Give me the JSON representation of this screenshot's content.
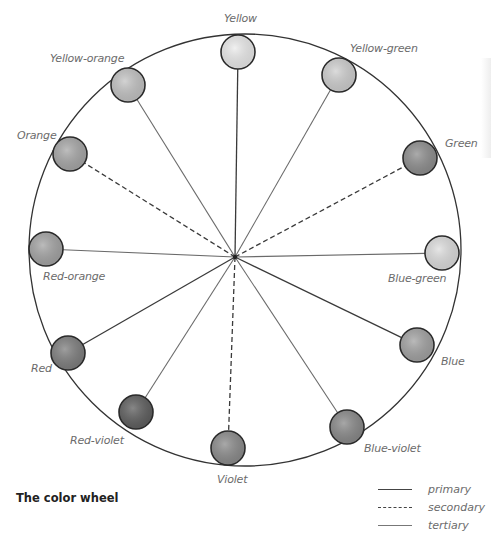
{
  "diagram": {
    "title": "The color wheel",
    "outer_circle": {
      "cx": 245,
      "cy": 250,
      "r": 216,
      "stroke": "#333333"
    },
    "hub": {
      "x": 235,
      "y": 257
    },
    "swatch_radius": 17,
    "swatches": [
      {
        "name": "Yellow",
        "type": "primary",
        "cx": 238,
        "cy": 52,
        "fill": "#ececec",
        "label_x": 224,
        "label_y": 12
      },
      {
        "name": "Yellow-green",
        "type": "tertiary",
        "cx": 339,
        "cy": 75,
        "fill": "#d0d0d0",
        "label_x": 350,
        "label_y": 42
      },
      {
        "name": "Green",
        "type": "secondary",
        "cx": 420,
        "cy": 158,
        "fill": "#8f8f8f",
        "label_x": 445,
        "label_y": 137
      },
      {
        "name": "Blue-green",
        "type": "tertiary",
        "cx": 442,
        "cy": 253,
        "fill": "#dedede",
        "label_x": 388,
        "label_y": 272
      },
      {
        "name": "Blue",
        "type": "primary",
        "cx": 417,
        "cy": 345,
        "fill": "#a3a3a3",
        "label_x": 441,
        "label_y": 355
      },
      {
        "name": "Blue-violet",
        "type": "tertiary",
        "cx": 347,
        "cy": 427,
        "fill": "#8a8a8a",
        "label_x": 364,
        "label_y": 442
      },
      {
        "name": "Violet",
        "type": "secondary",
        "cx": 228,
        "cy": 448,
        "fill": "#8c8c8c",
        "label_x": 217,
        "label_y": 473
      },
      {
        "name": "Red-violet",
        "type": "tertiary",
        "cx": 136,
        "cy": 412,
        "fill": "#5f5f5f",
        "label_x": 70,
        "label_y": 434
      },
      {
        "name": "Red",
        "type": "primary",
        "cx": 68,
        "cy": 353,
        "fill": "#7f7f7f",
        "label_x": 31,
        "label_y": 362
      },
      {
        "name": "Red-orange",
        "type": "tertiary",
        "cx": 46,
        "cy": 249,
        "fill": "#a5a5a5",
        "label_x": 43,
        "label_y": 270
      },
      {
        "name": "Orange",
        "type": "secondary",
        "cx": 70,
        "cy": 154,
        "fill": "#a8a8a8",
        "label_x": 17,
        "label_y": 129
      },
      {
        "name": "Yellow-orange",
        "type": "tertiary",
        "cx": 128,
        "cy": 85,
        "fill": "#c4c4c4",
        "label_x": 50,
        "label_y": 52
      }
    ],
    "legend": [
      {
        "style": "solid-primary",
        "label": "primary"
      },
      {
        "style": "dashed",
        "label": "secondary"
      },
      {
        "style": "solid-tertiary",
        "label": "tertiary"
      }
    ]
  }
}
